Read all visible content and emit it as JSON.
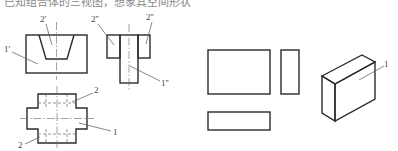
{
  "caption_cutoff": "已知组合体的三视图，想象其空间形状",
  "views": {
    "front_view": {
      "labels": {
        "outer": "1'",
        "cutout": "2'"
      }
    },
    "side_view": {
      "labels": {
        "left_block": "2''",
        "right_block": "2''",
        "stem": "1''"
      }
    },
    "top_view": {
      "labels": {
        "upper_arm": "2",
        "lower_arm": "2",
        "center": "1"
      }
    },
    "component_views": {
      "shapes": [
        "front-rectangle",
        "side-rectangle",
        "top-rectangle"
      ]
    },
    "isometric": {
      "label": "1"
    }
  },
  "colors": {
    "line": "#2b2b2b",
    "thin_line": "#555555",
    "label": "#444444"
  }
}
